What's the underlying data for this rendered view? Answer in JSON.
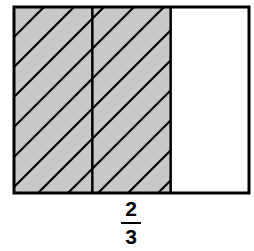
{
  "diagram": {
    "total_parts": 3,
    "shaded_parts": 2,
    "shaded_fill_color": "#c8c8c8",
    "hatch_color": "#000000",
    "unshaded_fill_color": "#ffffff",
    "border_color": "#000000"
  },
  "fraction": {
    "numerator": "2",
    "denominator": "3"
  }
}
